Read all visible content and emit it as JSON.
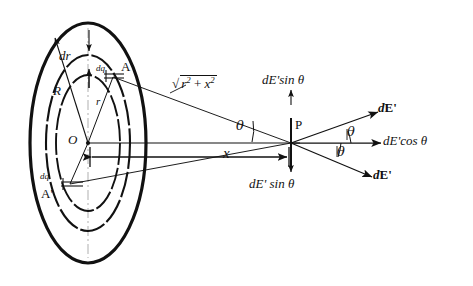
{
  "figure": {
    "type": "physics-diagram",
    "background_color": "#ffffff",
    "ink_color": "#111111"
  },
  "labels": {
    "disk_radius": "R",
    "ring_radius": "r",
    "ring_thickness": "dr",
    "charge_element_top": "dq",
    "charge_element_bottom": "dq",
    "point_a_top": "A",
    "point_a_bottom": "A'",
    "center_origin": "O",
    "field_point": "P",
    "axial_distance": "x",
    "distance_radical_prefix": "√",
    "distance_radical_body": "r² + x²",
    "distance_r_sq": "r",
    "distance_r_exp": "2",
    "distance_plus": "+",
    "distance_x_sq": "x",
    "distance_x_exp": "2",
    "angle_at_o": "θ",
    "angle_upper_at_p": "θ",
    "angle_lower_at_p": "θ",
    "sin_component_top": "dE'sin θ",
    "sin_component_bottom": "dE' sin θ",
    "cos_component": "dE'cos θ",
    "field_vector_upper_d": "d",
    "field_vector_upper_E": "E",
    "field_vector_upper_prime": "'",
    "field_vector_lower_d": "d",
    "field_vector_lower_E": "E",
    "field_vector_lower_prime": "'"
  },
  "geometry": {
    "center": {
      "x": 88,
      "y": 143
    },
    "field_point": {
      "x": 291,
      "y": 143
    },
    "disk_semi_axis_x": 58,
    "disk_semi_axis_y": 120,
    "ring_outer_semi_x": 42,
    "ring_outer_semi_y": 88,
    "ring_inner_semi_x": 32,
    "ring_inner_semi_y": 68,
    "point_a_top": {
      "x": 113,
      "y": 76
    },
    "point_a_bottom": {
      "x": 72,
      "y": 186
    },
    "axial_distance_px": 203
  },
  "vectors": [
    {
      "name": "dE-prime-upper",
      "angle_deg": -14,
      "label": "dE'"
    },
    {
      "name": "dE-prime-cos",
      "angle_deg": 0,
      "label": "dE'cos θ"
    },
    {
      "name": "dE-prime-lower",
      "angle_deg": 17,
      "label": "dE'"
    },
    {
      "name": "dE-prime-sin-up",
      "angle_deg": -90,
      "label": "dE'sin θ"
    },
    {
      "name": "dE-prime-sin-down",
      "angle_deg": 90,
      "label": "dE' sin θ"
    }
  ]
}
